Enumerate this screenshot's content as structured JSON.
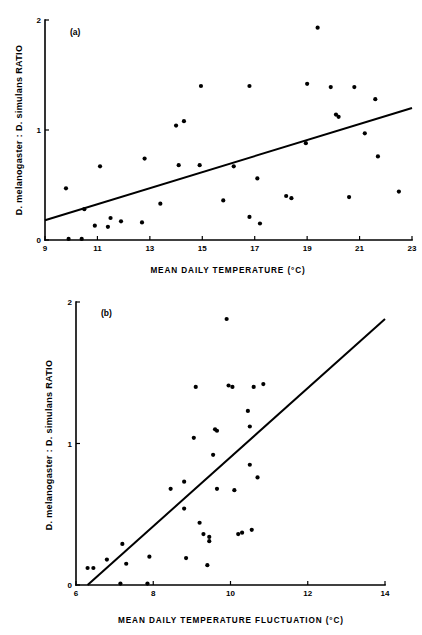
{
  "figure": {
    "name": "two-panel-scatter-figure",
    "background": "#ffffff",
    "ink_color": "#000000"
  },
  "chart_data": [
    {
      "type": "scatter",
      "panel": "(a)",
      "title": "",
      "xlabel": "MEAN  DAILY  TEMPERATURE  (°C)",
      "ylabel": "D. melanogaster : D. simulans  RATIO",
      "xlim": [
        9,
        23
      ],
      "ylim": [
        0,
        2
      ],
      "xticks": [
        9,
        11,
        13,
        15,
        17,
        19,
        21,
        23
      ],
      "xtick_labels": [
        "9",
        "11",
        "13",
        "15",
        "17",
        "19",
        "21",
        "23"
      ],
      "yticks": [
        0,
        1,
        2
      ],
      "ytick_labels": [
        "0",
        "1",
        "2"
      ],
      "grid": false,
      "legend": "none",
      "marker": "filled-circle",
      "points": [
        [
          9.8,
          0.47
        ],
        [
          9.9,
          0.01
        ],
        [
          10.4,
          0.01
        ],
        [
          10.5,
          0.28
        ],
        [
          10.9,
          0.13
        ],
        [
          11.1,
          0.67
        ],
        [
          11.4,
          0.12
        ],
        [
          11.5,
          0.2
        ],
        [
          11.9,
          0.17
        ],
        [
          12.7,
          0.16
        ],
        [
          12.8,
          0.74
        ],
        [
          13.4,
          0.33
        ],
        [
          14.0,
          1.04
        ],
        [
          14.1,
          0.68
        ],
        [
          14.3,
          1.08
        ],
        [
          14.9,
          0.68
        ],
        [
          14.95,
          1.4
        ],
        [
          15.8,
          0.36
        ],
        [
          16.2,
          0.67
        ],
        [
          16.8,
          1.4
        ],
        [
          16.8,
          0.21
        ],
        [
          17.1,
          0.56
        ],
        [
          17.2,
          0.15
        ],
        [
          18.2,
          0.4
        ],
        [
          18.4,
          0.38
        ],
        [
          18.95,
          0.88
        ],
        [
          19.0,
          1.42
        ],
        [
          19.4,
          1.93
        ],
        [
          19.9,
          1.39
        ],
        [
          20.1,
          1.14
        ],
        [
          20.2,
          1.12
        ],
        [
          20.6,
          0.39
        ],
        [
          20.8,
          1.39
        ],
        [
          21.2,
          0.97
        ],
        [
          21.6,
          1.28
        ],
        [
          21.7,
          0.76
        ],
        [
          22.5,
          0.44
        ]
      ],
      "regression": {
        "x0": 9.0,
        "y0": 0.18,
        "x1": 23.0,
        "y1": 1.2
      }
    },
    {
      "type": "scatter",
      "panel": "(b)",
      "title": "",
      "xlabel": "MEAN  DAILY  TEMPERATURE  FLUCTUATION (°C)",
      "ylabel": "D. melanogaster : D. simulans  RATIO",
      "xlim": [
        6,
        14
      ],
      "ylim": [
        0,
        2
      ],
      "xticks": [
        6,
        8,
        10,
        12,
        14
      ],
      "xtick_labels": [
        "6",
        "8",
        "10",
        "12",
        "14"
      ],
      "yticks": [
        0,
        1,
        2
      ],
      "ytick_labels": [
        "0",
        "1",
        "2"
      ],
      "grid": false,
      "legend": "none",
      "marker": "filled-circle",
      "points": [
        [
          6.3,
          0.12
        ],
        [
          6.45,
          0.12
        ],
        [
          6.8,
          0.18
        ],
        [
          7.15,
          0.01
        ],
        [
          7.2,
          0.29
        ],
        [
          7.3,
          0.15
        ],
        [
          7.85,
          0.01
        ],
        [
          7.9,
          0.2
        ],
        [
          8.45,
          0.68
        ],
        [
          8.8,
          0.54
        ],
        [
          8.8,
          0.73
        ],
        [
          8.85,
          0.19
        ],
        [
          9.05,
          1.04
        ],
        [
          9.1,
          1.4
        ],
        [
          9.2,
          0.44
        ],
        [
          9.3,
          0.36
        ],
        [
          9.4,
          0.14
        ],
        [
          9.45,
          0.34
        ],
        [
          9.45,
          0.31
        ],
        [
          9.55,
          0.92
        ],
        [
          9.6,
          1.1
        ],
        [
          9.65,
          1.09
        ],
        [
          9.65,
          0.68
        ],
        [
          9.9,
          1.88
        ],
        [
          9.95,
          1.41
        ],
        [
          10.05,
          1.4
        ],
        [
          10.1,
          0.67
        ],
        [
          10.2,
          0.36
        ],
        [
          10.3,
          0.37
        ],
        [
          10.45,
          1.23
        ],
        [
          10.5,
          1.12
        ],
        [
          10.5,
          0.85
        ],
        [
          10.55,
          0.39
        ],
        [
          10.6,
          1.4
        ],
        [
          10.7,
          0.76
        ],
        [
          10.85,
          1.42
        ]
      ],
      "regression": {
        "x0": 6.3,
        "y0": 0.0,
        "x1": 14.0,
        "y1": 1.88
      }
    }
  ]
}
